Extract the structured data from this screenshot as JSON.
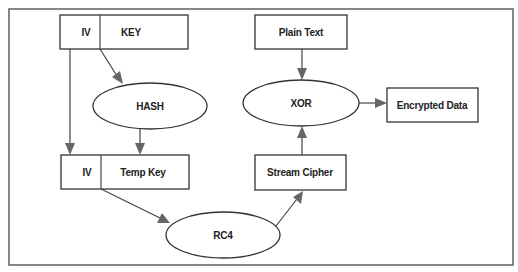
{
  "diagram": {
    "title": "",
    "nodes": {
      "iv_top": {
        "label": "IV",
        "shape": "box"
      },
      "key": {
        "label": "KEY",
        "shape": "box"
      },
      "hash": {
        "label": "HASH",
        "shape": "ellipse"
      },
      "iv_bottom": {
        "label": "IV",
        "shape": "box"
      },
      "temp_key": {
        "label": "Temp Key",
        "shape": "box"
      },
      "rc4": {
        "label": "RC4",
        "shape": "ellipse"
      },
      "stream_cipher": {
        "label": "Stream Cipher",
        "shape": "box"
      },
      "xor": {
        "label": "XOR",
        "shape": "ellipse"
      },
      "plain_text": {
        "label": "Plain Text",
        "shape": "box"
      },
      "encrypted_data": {
        "label": "Encrypted Data",
        "shape": "box"
      }
    },
    "edges": [
      {
        "from": "key",
        "to": "hash"
      },
      {
        "from": "iv_top",
        "to": "iv_bottom"
      },
      {
        "from": "hash",
        "to": "temp_key"
      },
      {
        "from": "iv_bottom",
        "to": "rc4"
      },
      {
        "from": "rc4",
        "to": "stream_cipher"
      },
      {
        "from": "stream_cipher",
        "to": "xor"
      },
      {
        "from": "plain_text",
        "to": "xor"
      },
      {
        "from": "xor",
        "to": "encrypted_data"
      }
    ],
    "colors": {
      "stroke": "#333333",
      "arrowhead": "#666666",
      "background": "#ffffff"
    }
  }
}
